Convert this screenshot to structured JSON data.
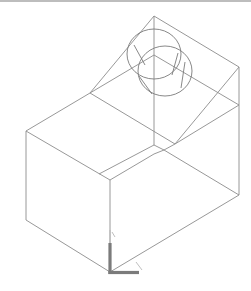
{
  "viewport": {
    "name": "CAD model viewport",
    "background": "#ffffff",
    "line_color": "#8c8c8c",
    "view": "isometric wireframe"
  },
  "model": {
    "description": "L-shaped block with sloped top and cylinder boss",
    "ucs_icon": {
      "x_label": "X",
      "y_label": "Y",
      "color": "#7b7b7b"
    }
  }
}
